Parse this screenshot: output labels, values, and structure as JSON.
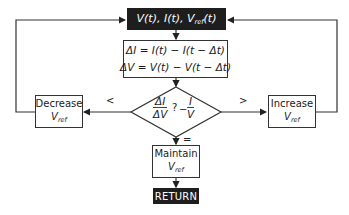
{
  "diagram": {
    "type": "flowchart",
    "nodes": {
      "start": {
        "label": "V(t), I(t), V",
        "ref_sub": "ref",
        "label_tail": "(t)"
      },
      "compute": {
        "line1": "ΔI = I(t) − I(t − Δt)",
        "line2": "ΔV = V(t) − V(t − Δt)"
      },
      "decision": {
        "lhs_num": "ΔI",
        "lhs_den": "ΔV",
        "op": "?",
        "minus": "−",
        "rhs_num": "I",
        "rhs_den": "V"
      },
      "decrease": {
        "line1": "Decrease",
        "var": "V",
        "sub": "ref"
      },
      "increase": {
        "line1": "Increase",
        "var": "V",
        "sub": "ref"
      },
      "maintain": {
        "line1": "Maintain",
        "var": "V",
        "sub": "ref"
      },
      "return": {
        "label": "RETURN"
      }
    },
    "edge_labels": {
      "less": "<",
      "greater": ">",
      "equal": "="
    },
    "colors": {
      "dark_fill": "#1e1e1e",
      "line": "#333333",
      "background": "#ffffff"
    }
  }
}
